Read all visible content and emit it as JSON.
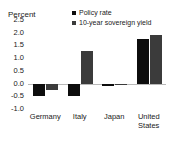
{
  "chart_data": {
    "type": "bar",
    "title": "",
    "subtitle": "",
    "xlabel": "",
    "ylabel": "Percent",
    "ylim": [
      -1.0,
      2.5
    ],
    "ytick_labels": [
      "2.5",
      "2.0",
      "1.5",
      "1.0",
      "0.5",
      "0.0",
      "-0.5",
      "-1.0"
    ],
    "ytick_values": [
      2.5,
      2.0,
      1.5,
      1.0,
      0.5,
      0.0,
      -0.5,
      -1.0
    ],
    "grid": false,
    "legend_position": "top-center",
    "categories": [
      "Germany",
      "Italy",
      "Japan",
      "United States"
    ],
    "category_lines": [
      [
        "Germany"
      ],
      [
        "Italy"
      ],
      [
        "Japan"
      ],
      [
        "United",
        "States"
      ]
    ],
    "series": [
      {
        "name": "Policy rate",
        "color": "#0d0d0d",
        "values": [
          -0.5,
          -0.5,
          -0.1,
          1.75
        ]
      },
      {
        "name": "10-year sovereign yield",
        "color": "#3b3b3b",
        "values": [
          -0.25,
          1.3,
          -0.05,
          1.9
        ]
      }
    ],
    "zero_line_color": "#b9b9b9",
    "text_color": "#1a1a1a",
    "background": "#ffffff"
  }
}
